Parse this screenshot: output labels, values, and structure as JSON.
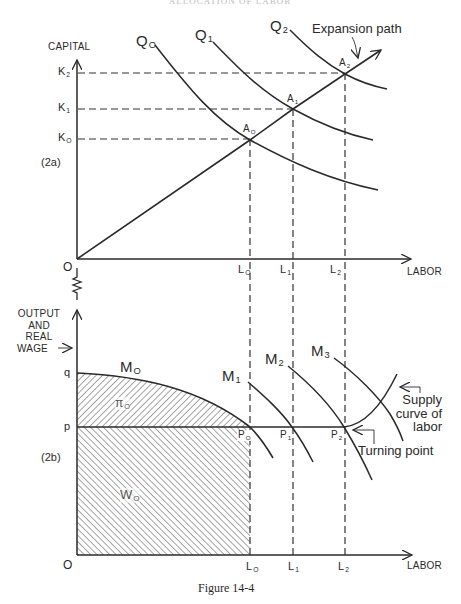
{
  "header": {
    "text": "ALLOCATION OF LABOR"
  },
  "caption": "Figure 14-4",
  "colors": {
    "ink": "#2a2a2a",
    "background": "#ffffff"
  },
  "panel_a": {
    "tag": "(2a)",
    "y_axis_label": "CAPITAL",
    "x_axis_label": "LABOR",
    "origin": "O",
    "y_ticks": [
      {
        "main": "K",
        "sub": "2"
      },
      {
        "main": "K",
        "sub": "1"
      },
      {
        "main": "K",
        "sub": "O"
      }
    ],
    "x_ticks": [
      {
        "main": "L",
        "sub": "O"
      },
      {
        "main": "L",
        "sub": "1"
      },
      {
        "main": "L",
        "sub": "2"
      }
    ],
    "isoquants": [
      {
        "main": "Q",
        "sub": "O"
      },
      {
        "main": "Q",
        "sub": "1"
      },
      {
        "main": "Q",
        "sub": "2"
      }
    ],
    "points": [
      {
        "main": "A",
        "sub": "O"
      },
      {
        "main": "A",
        "sub": "1"
      },
      {
        "main": "A",
        "sub": "2"
      }
    ],
    "expansion_label": "Expansion path"
  },
  "panel_b": {
    "tag": "(2b)",
    "y_axis_label": [
      "OUTPUT",
      "AND",
      "REAL",
      "WAGE"
    ],
    "y_axis_arrow": "→",
    "x_axis_label": "LABOR",
    "origin": "O",
    "y_ticks": {
      "q": "q",
      "p": "p"
    },
    "x_ticks": [
      {
        "main": "L",
        "sub": "O"
      },
      {
        "main": "L",
        "sub": "1"
      },
      {
        "main": "L",
        "sub": "2"
      }
    ],
    "curves": [
      {
        "main": "M",
        "sub": "O"
      },
      {
        "main": "M",
        "sub": "1"
      },
      {
        "main": "M",
        "sub": "2"
      },
      {
        "main": "M",
        "sub": "3"
      }
    ],
    "points": [
      {
        "main": "P",
        "sub": "O"
      },
      {
        "main": "P",
        "sub": "1"
      },
      {
        "main": "P",
        "sub": "2"
      }
    ],
    "areas": {
      "profit": {
        "main": "π",
        "sub": "O"
      },
      "wages": {
        "main": "W",
        "sub": "O"
      }
    },
    "supply_label": [
      "Supply",
      "curve of",
      "labor"
    ],
    "turning_label": "Turning point"
  }
}
